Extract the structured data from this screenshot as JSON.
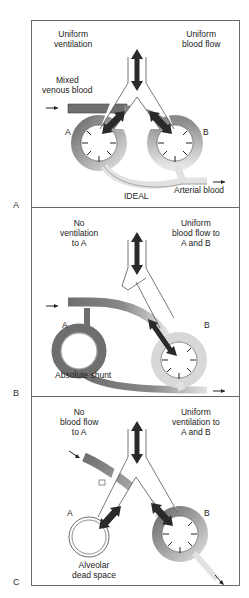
{
  "figure": {
    "panels": [
      {
        "id": "A",
        "label": "A",
        "top_left": "Uniform\nventilation",
        "top_left_lines": [
          "Uniform",
          "ventilation"
        ],
        "top_right_lines": [
          "Uniform",
          "blood flow"
        ],
        "inflow_label_lines": [
          "Mixed",
          "venous blood"
        ],
        "alveolus_left": "A",
        "alveolus_right": "B",
        "caption": "IDEAL",
        "outflow_label": "Arterial blood"
      },
      {
        "id": "B",
        "label": "B",
        "top_left_lines": [
          "No",
          "ventilation",
          "to A"
        ],
        "top_right_lines": [
          "Uniform",
          "blood flow to",
          "A and B"
        ],
        "alveolus_left": "A",
        "alveolus_right": "B",
        "caption": "Absolute shunt"
      },
      {
        "id": "C",
        "label": "C",
        "top_left_lines": [
          "No",
          "blood flow",
          "to A"
        ],
        "top_right_lines": [
          "Uniform",
          "ventilation to",
          "A and B"
        ],
        "alveolus_left": "A",
        "alveolus_right": "B",
        "caption_lines": [
          "Alveolar",
          "dead space"
        ]
      }
    ],
    "colors": {
      "border": "#6a6a6a",
      "venous": "#6e6e6e",
      "mixed": "#a8a8a8",
      "arterial": "#e4e4e4",
      "arrow": "#2a2a2a"
    }
  }
}
